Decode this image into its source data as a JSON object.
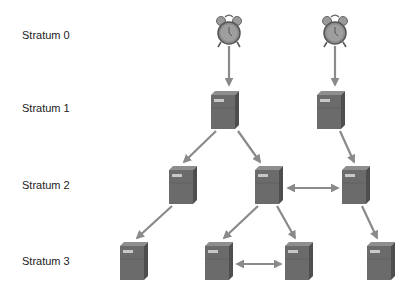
{
  "strata_labels": [
    {
      "label": "Stratum 0",
      "y": 35
    },
    {
      "label": "Stratum 1",
      "y": 108
    },
    {
      "label": "Stratum 2",
      "y": 185
    },
    {
      "label": "Stratum 3",
      "y": 261
    }
  ],
  "colors": {
    "arrow": "#8a8a8a",
    "server_front": "#6b6b6b",
    "server_side": "#4e4e4e",
    "server_top": "#8e8e8e",
    "clock": "#8c8c8c"
  },
  "nodes": {
    "clocks": [
      {
        "id": "clock-a",
        "stratum": 0,
        "cx": 229,
        "cy": 33
      },
      {
        "id": "clock-b",
        "stratum": 0,
        "cx": 335,
        "cy": 33
      }
    ],
    "servers": [
      {
        "id": "s1-a",
        "stratum": 1,
        "x": 211,
        "y": 91
      },
      {
        "id": "s1-b",
        "stratum": 1,
        "x": 317,
        "y": 91
      },
      {
        "id": "s2-a",
        "stratum": 2,
        "x": 169,
        "y": 166
      },
      {
        "id": "s2-b",
        "stratum": 2,
        "x": 255,
        "y": 166
      },
      {
        "id": "s2-c",
        "stratum": 2,
        "x": 342,
        "y": 166
      },
      {
        "id": "s3-a",
        "stratum": 3,
        "x": 120,
        "y": 242
      },
      {
        "id": "s3-b",
        "stratum": 3,
        "x": 205,
        "y": 242
      },
      {
        "id": "s3-c",
        "stratum": 3,
        "x": 285,
        "y": 242
      },
      {
        "id": "s3-d",
        "stratum": 3,
        "x": 367,
        "y": 242
      }
    ]
  },
  "edges": [
    {
      "from": "clock-a",
      "to": "s1-a",
      "type": "one-way"
    },
    {
      "from": "clock-b",
      "to": "s1-b",
      "type": "one-way"
    },
    {
      "from": "s1-a",
      "to": "s2-a",
      "type": "one-way"
    },
    {
      "from": "s1-a",
      "to": "s2-b",
      "type": "one-way"
    },
    {
      "from": "s1-b",
      "to": "s2-c",
      "type": "one-way"
    },
    {
      "from": "s2-b",
      "to": "s2-c",
      "type": "two-way"
    },
    {
      "from": "s2-a",
      "to": "s3-a",
      "type": "one-way"
    },
    {
      "from": "s2-b",
      "to": "s3-b",
      "type": "one-way"
    },
    {
      "from": "s2-b",
      "to": "s3-c",
      "type": "one-way"
    },
    {
      "from": "s2-c",
      "to": "s3-d",
      "type": "one-way"
    },
    {
      "from": "s3-b",
      "to": "s3-c",
      "type": "two-way"
    }
  ]
}
